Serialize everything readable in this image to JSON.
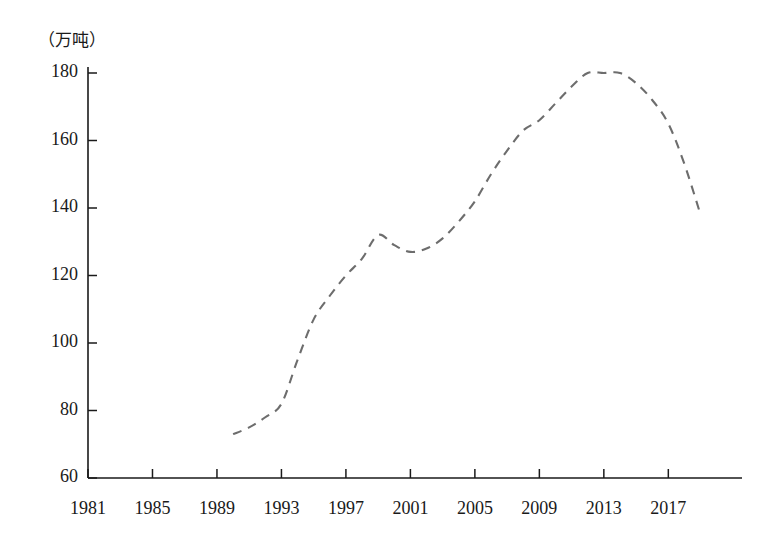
{
  "chart_data": {
    "type": "line",
    "title": "",
    "subtitle": "",
    "unit_label": "（万吨）",
    "xlabel": "",
    "ylabel": "",
    "xlim": [
      1981,
      2020
    ],
    "ylim": [
      60,
      180
    ],
    "grid": false,
    "legend": "none",
    "line_style": "dashed",
    "line_color": "#6d6d6d",
    "axis_color": "#1a1a1a",
    "x_ticks": [
      "1981",
      "1985",
      "1989",
      "1993",
      "1997",
      "2001",
      "2005",
      "2009",
      "2013",
      "2017"
    ],
    "x_tick_values": [
      1981,
      1985,
      1989,
      1993,
      1997,
      2001,
      2005,
      2009,
      2013,
      2017
    ],
    "y_ticks": [
      "60",
      "80",
      "100",
      "120",
      "140",
      "160",
      "180"
    ],
    "y_tick_values": [
      60,
      80,
      100,
      120,
      140,
      160,
      180
    ],
    "x": [
      1990,
      1991,
      1992,
      1993,
      1994,
      1995,
      1996,
      1997,
      1998,
      1999,
      2000,
      2001,
      2002,
      2003,
      2004,
      2005,
      2006,
      2007,
      2008,
      2009,
      2010,
      2011,
      2012,
      2013,
      2014,
      2015,
      2016,
      2017,
      2018,
      2019
    ],
    "values": [
      73,
      75,
      78,
      82,
      95,
      107,
      114,
      120,
      125,
      132,
      129,
      127,
      128,
      131,
      136,
      142,
      150,
      157,
      163,
      166,
      171,
      176,
      180,
      180,
      180,
      177,
      172,
      165,
      153,
      138
    ],
    "series": [
      {
        "name": "产量",
        "values": [
          73,
          75,
          78,
          82,
          95,
          107,
          114,
          120,
          125,
          132,
          129,
          127,
          128,
          131,
          136,
          142,
          150,
          157,
          163,
          166,
          171,
          176,
          180,
          180,
          180,
          177,
          172,
          165,
          153,
          138
        ]
      }
    ]
  },
  "axes": {
    "unit": "（万吨）"
  }
}
